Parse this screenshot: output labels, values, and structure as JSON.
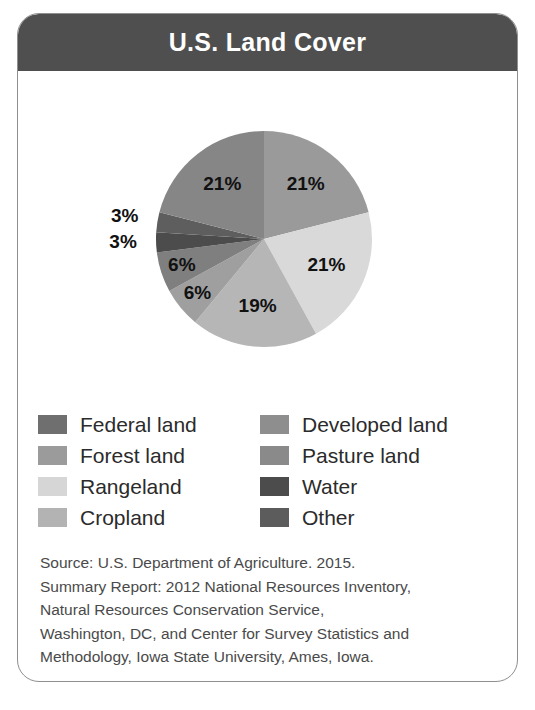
{
  "card": {
    "title": "U.S. Land Cover"
  },
  "chart_data": {
    "type": "pie",
    "title": "U.S. Land Cover",
    "xlabel": "",
    "ylabel": "",
    "legend_position": "below",
    "grid": false,
    "unit": "%",
    "categories": [
      "Developed land",
      "Rangeland",
      "Cropland",
      "Pasture land",
      "Forest land",
      "Water",
      "Other",
      "Federal land"
    ],
    "values": [
      21,
      21,
      19,
      6,
      6,
      3,
      3,
      21
    ],
    "slices": [
      {
        "label": "Developed land",
        "value": 21,
        "display": "21%",
        "color": "#9a9a9a"
      },
      {
        "label": "Rangeland",
        "value": 21,
        "display": "21%",
        "color": "#d9d9d9"
      },
      {
        "label": "Cropland",
        "value": 19,
        "display": "19%",
        "color": "#b6b6b6"
      },
      {
        "label": "Pasture land",
        "value": 6,
        "display": "6%",
        "color": "#9f9f9f"
      },
      {
        "label": "Forest land",
        "value": 6,
        "display": "6%",
        "color": "#7f7f7f"
      },
      {
        "label": "Water",
        "value": 3,
        "display": "3%",
        "color": "#4c4c4c"
      },
      {
        "label": "Other",
        "value": 3,
        "display": "3%",
        "color": "#5e5e5e"
      },
      {
        "label": "Federal land",
        "value": 21,
        "display": "21%",
        "color": "#868686"
      }
    ]
  },
  "legend": {
    "items": [
      {
        "label": "Federal land",
        "color": "#6f6f6f"
      },
      {
        "label": "Developed land",
        "color": "#8e8e8e"
      },
      {
        "label": "Forest land",
        "color": "#9b9b9b"
      },
      {
        "label": "Pasture land",
        "color": "#8a8a8a"
      },
      {
        "label": "Rangeland",
        "color": "#d6d6d6"
      },
      {
        "label": "Water",
        "color": "#4c4c4c"
      },
      {
        "label": "Cropland",
        "color": "#b3b3b3"
      },
      {
        "label": "Other",
        "color": "#5c5c5c"
      }
    ]
  },
  "source": {
    "lines": [
      "Source: U.S. Department of Agriculture. 2015.",
      "Summary Report: 2012 National Resources Inventory,",
      "Natural Resources Conservation Service,",
      "Washington, DC, and Center for Survey Statistics and",
      "Methodology, Iowa State University, Ames, Iowa."
    ]
  },
  "colors": {
    "title_bar": "#4f4f4f",
    "title_text": "#ffffff",
    "card_border": "#8f8f8f",
    "background": "#ffffff",
    "body_text": "#2b2b2b",
    "source_text": "#4a4a4a"
  }
}
